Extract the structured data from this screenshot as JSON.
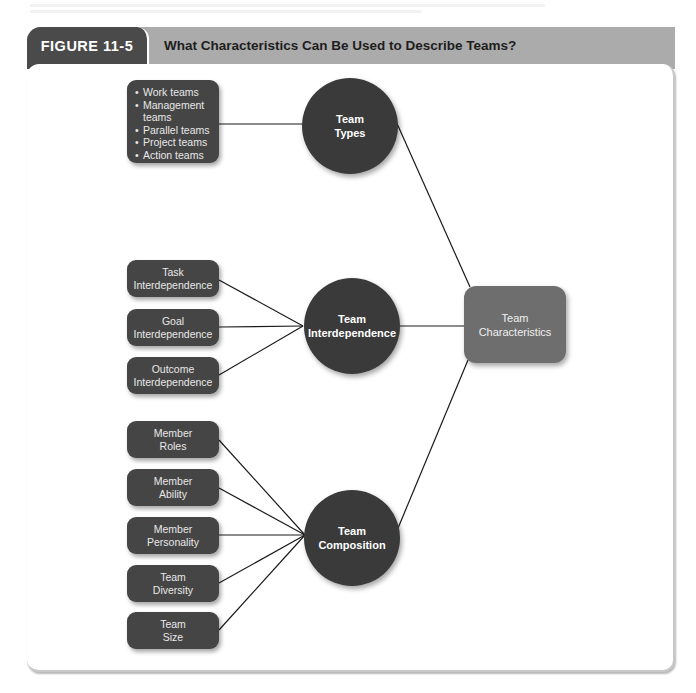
{
  "figure": {
    "number": "FIGURE 11-5",
    "title": "What Characteristics Can Be Used to Describe Teams?"
  },
  "center_node": {
    "line1": "Team",
    "line2": "Characteristics"
  },
  "hubs": [
    {
      "line1": "Team",
      "line2": "Types"
    },
    {
      "line1": "Team",
      "line2": "Interdependence"
    },
    {
      "line1": "Team",
      "line2": "Composition"
    }
  ],
  "team_types_list": [
    "Work teams",
    "Management teams",
    "Parallel teams",
    "Project teams",
    "Action teams"
  ],
  "interdependence_items": [
    {
      "line1": "Task",
      "line2": "Interdependence"
    },
    {
      "line1": "Goal",
      "line2": "Interdependence"
    },
    {
      "line1": "Outcome",
      "line2": "Interdependence"
    }
  ],
  "composition_items": [
    {
      "line1": "Member",
      "line2": "Roles"
    },
    {
      "line1": "Member",
      "line2": "Ability"
    },
    {
      "line1": "Member",
      "line2": "Personality"
    },
    {
      "line1": "Team",
      "line2": "Diversity"
    },
    {
      "line1": "Team",
      "line2": "Size"
    }
  ],
  "colors": {
    "header_bar": "#ababab",
    "figure_tab": "#4a4a4a",
    "leaf_box": "#454545",
    "hub_circle": "#3a3a3a",
    "center_box": "#6e6e6e",
    "connector": "#1a1a1a"
  }
}
